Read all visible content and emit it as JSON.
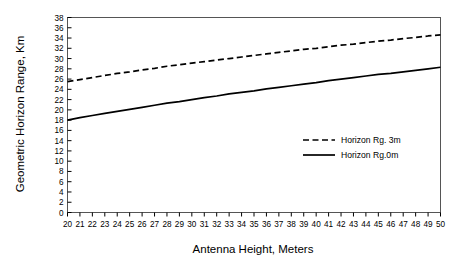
{
  "chart_data": {
    "type": "line",
    "title": "",
    "xlabel": "Antenna Height, Meters",
    "ylabel": "Geometric Horizon Range, Km",
    "xlim": [
      20,
      50
    ],
    "ylim": [
      0,
      38
    ],
    "xticks": [
      20,
      21,
      22,
      23,
      24,
      25,
      26,
      27,
      28,
      29,
      30,
      31,
      32,
      33,
      34,
      35,
      36,
      37,
      38,
      39,
      40,
      41,
      42,
      43,
      44,
      45,
      46,
      47,
      48,
      49,
      50
    ],
    "yticks": [
      0,
      2,
      4,
      6,
      8,
      10,
      12,
      14,
      16,
      18,
      20,
      22,
      24,
      26,
      28,
      30,
      32,
      34,
      36,
      38
    ],
    "grid": false,
    "legend_position": "center-right",
    "x": [
      20,
      21,
      22,
      23,
      24,
      25,
      26,
      27,
      28,
      29,
      30,
      31,
      32,
      33,
      34,
      35,
      36,
      37,
      38,
      39,
      40,
      41,
      42,
      43,
      44,
      45,
      46,
      47,
      48,
      49,
      50
    ],
    "series": [
      {
        "name": "Horizon Rg. 3m",
        "style": "dashed",
        "color": "#000000",
        "values": [
          25.5,
          25.9,
          26.3,
          26.7,
          27.1,
          27.4,
          27.8,
          28.1,
          28.5,
          28.8,
          29.1,
          29.4,
          29.7,
          30.0,
          30.3,
          30.6,
          30.9,
          31.2,
          31.5,
          31.8,
          32.0,
          32.3,
          32.6,
          32.8,
          33.1,
          33.4,
          33.6,
          33.9,
          34.1,
          34.4,
          34.6
        ]
      },
      {
        "name": "Horizon Rg.0m",
        "style": "solid",
        "color": "#000000",
        "values": [
          18.0,
          18.5,
          18.9,
          19.3,
          19.7,
          20.1,
          20.5,
          20.9,
          21.3,
          21.6,
          22.0,
          22.4,
          22.7,
          23.1,
          23.4,
          23.7,
          24.1,
          24.4,
          24.7,
          25.0,
          25.3,
          25.7,
          26.0,
          26.3,
          26.6,
          26.9,
          27.1,
          27.4,
          27.7,
          28.0,
          28.3
        ]
      }
    ]
  },
  "legend": {
    "items": [
      {
        "label": "Horizon Rg. 3m",
        "style": "dashed"
      },
      {
        "label": "Horizon Rg.0m",
        "style": "solid"
      }
    ]
  }
}
